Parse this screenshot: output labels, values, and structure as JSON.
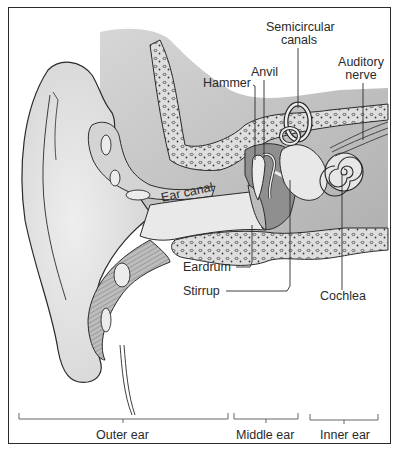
{
  "figure": {
    "colors": {
      "ink": "#2a2a2a",
      "skin": "#e4e4e4",
      "cartilage": "#cfcfcf",
      "bone": "#dcdcdc",
      "dark_tissue": "#8a8a8a",
      "cavity": "#9a9a9a"
    }
  },
  "labels": {
    "semicircular_canals_line1": "Semicircular",
    "semicircular_canals_line2": "canals",
    "auditory_nerve_line1": "Auditory",
    "auditory_nerve_line2": "nerve",
    "anvil": "Anvil",
    "hammer": "Hammer",
    "ear_canal": "Ear canal",
    "eardrum": "Eardrum",
    "stirrup": "Stirrup",
    "cochlea": "Cochlea"
  },
  "sections": [
    {
      "label": "Outer ear"
    },
    {
      "label": "Middle ear"
    },
    {
      "label": "Inner ear"
    }
  ]
}
